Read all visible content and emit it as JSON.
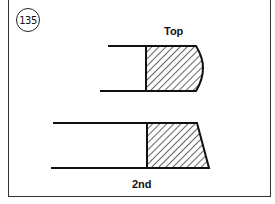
{
  "figure": {
    "number": "135",
    "rings": [
      {
        "label": "Top",
        "profile": "barrel-faced (rounded)"
      },
      {
        "label": "2nd",
        "profile": "taper-faced"
      }
    ]
  }
}
